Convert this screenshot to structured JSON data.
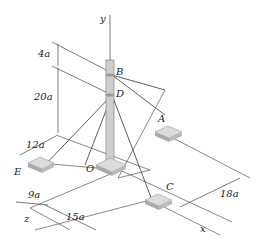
{
  "diagram": {
    "axes": {
      "y": "y",
      "x": "x",
      "z": "z",
      "origin": "O"
    },
    "points": {
      "B": "B",
      "D": "D",
      "A": "A",
      "C": "C",
      "E": "E"
    },
    "dimensions": {
      "d4": "4a",
      "d20": "20a",
      "d12": "12a",
      "d9": "9a",
      "d15": "15a",
      "d18": "18a"
    },
    "colors": {
      "pole": "#c9c9c9",
      "base": "#cfcfcf",
      "line": "#333333"
    }
  }
}
